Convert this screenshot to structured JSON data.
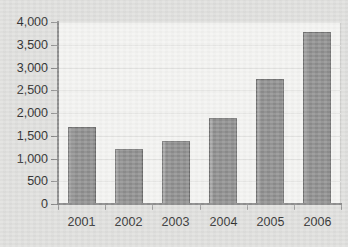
{
  "chart_data": {
    "type": "bar",
    "title": "",
    "subtitle": "",
    "xlabel": "",
    "ylabel": "",
    "categories": [
      "2001",
      "2002",
      "2003",
      "2004",
      "2005",
      "2006"
    ],
    "values": [
      1700,
      1200,
      1380,
      1880,
      2750,
      3780
    ],
    "series": [
      {
        "name": "",
        "values": [
          1700,
          1200,
          1380,
          1880,
          2750,
          3780
        ]
      }
    ],
    "ylim": [
      0,
      4000
    ],
    "ytick_values": [
      0,
      500,
      1000,
      1500,
      2000,
      2500,
      3000,
      3500,
      4000
    ],
    "ytick_labels": [
      "0",
      "500",
      "1,000",
      "1,500",
      "2,000",
      "2,500",
      "3,000",
      "3,500",
      "4,000"
    ],
    "xtick_labels": [
      "2001",
      "2002",
      "2003",
      "2004",
      "2005",
      "2006"
    ],
    "grid": true,
    "grid_axis": "y",
    "legend": false,
    "legend_position": "none",
    "colors": {
      "bar_fill": "#8d8d8d",
      "bar_edge": "#6f6f6f",
      "plot_background": "#f3f3f1",
      "figure_background": "#dfdfdd",
      "gridline": "#e3e3e1",
      "axis": "#909090",
      "text": "#2b2b2b"
    },
    "annotations": []
  }
}
